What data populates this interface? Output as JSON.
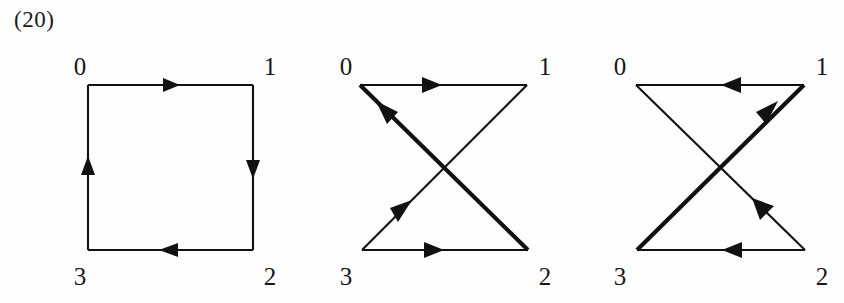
{
  "caption": "(20)",
  "figures": [
    {
      "id": "square",
      "name": "directed-square-cycle",
      "vertices": [
        {
          "label": "0",
          "position": "top-left"
        },
        {
          "label": "1",
          "position": "top-right"
        },
        {
          "label": "2",
          "position": "bottom-right"
        },
        {
          "label": "3",
          "position": "bottom-left"
        }
      ],
      "edges": [
        {
          "from": "0",
          "to": "1",
          "side": "top",
          "direction": "right",
          "weight": "thin"
        },
        {
          "from": "1",
          "to": "2",
          "side": "right",
          "direction": "down",
          "weight": "thin"
        },
        {
          "from": "2",
          "to": "3",
          "side": "bottom",
          "direction": "left",
          "weight": "thin"
        },
        {
          "from": "3",
          "to": "0",
          "side": "left",
          "direction": "up",
          "weight": "thin"
        }
      ]
    },
    {
      "id": "bowtie-cw",
      "name": "directed-bowtie-right",
      "vertices": [
        {
          "label": "0",
          "position": "top-left"
        },
        {
          "label": "1",
          "position": "top-right"
        },
        {
          "label": "2",
          "position": "bottom-right"
        },
        {
          "label": "3",
          "position": "bottom-left"
        }
      ],
      "edges": [
        {
          "from": "0",
          "to": "1",
          "side": "top",
          "direction": "right",
          "weight": "thin"
        },
        {
          "from": "3",
          "to": "2",
          "side": "bottom",
          "direction": "right",
          "weight": "thin"
        },
        {
          "from": "2",
          "to": "0",
          "side": "diagonal",
          "direction": "up-left",
          "weight": "thick"
        },
        {
          "from": "1",
          "to": "3",
          "side": "diagonal",
          "direction": "down-left",
          "weight": "thin"
        }
      ]
    },
    {
      "id": "bowtie-ccw",
      "name": "directed-bowtie-left",
      "vertices": [
        {
          "label": "0",
          "position": "top-left"
        },
        {
          "label": "1",
          "position": "top-right"
        },
        {
          "label": "2",
          "position": "bottom-right"
        },
        {
          "label": "3",
          "position": "bottom-left"
        }
      ],
      "edges": [
        {
          "from": "1",
          "to": "0",
          "side": "top",
          "direction": "left",
          "weight": "thin"
        },
        {
          "from": "2",
          "to": "3",
          "side": "bottom",
          "direction": "left",
          "weight": "thin"
        },
        {
          "from": "3",
          "to": "1",
          "side": "diagonal",
          "direction": "up-right",
          "weight": "thick"
        },
        {
          "from": "0",
          "to": "2",
          "side": "diagonal",
          "direction": "down-right",
          "weight": "thin"
        }
      ]
    }
  ],
  "colors": {
    "ink": "#111111",
    "background": "#fefefe",
    "label": "#171717"
  }
}
